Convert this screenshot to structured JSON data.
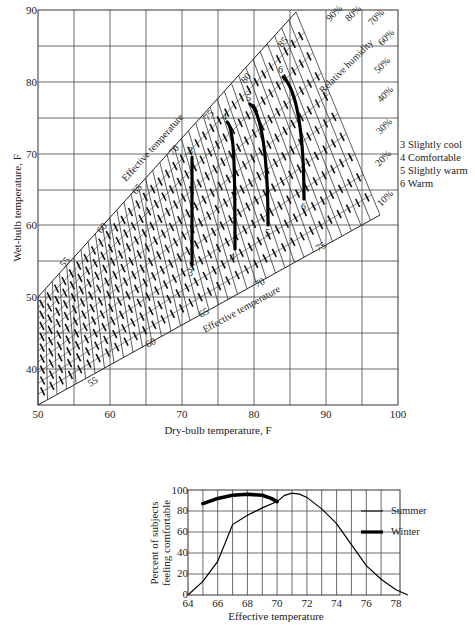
{
  "chart_data": [
    {
      "type": "line",
      "title": "",
      "xlabel": "Dry-bulb temperature, F",
      "ylabel": "Wet-bulb temperature, F",
      "xlim": [
        50,
        100
      ],
      "ylim": [
        35,
        90
      ],
      "x_ticks": [
        50,
        60,
        70,
        80,
        90,
        100
      ],
      "y_ticks": [
        40,
        50,
        60,
        70,
        80,
        90
      ],
      "grid": true,
      "band_labels": {
        "upper_boundary": "Effective temperature",
        "lower_boundary": "Effective temperature",
        "humidity_axis": "Relative humidity"
      },
      "effective_temperature_ticks_upper": [
        55,
        60,
        65,
        70,
        75,
        80,
        85
      ],
      "effective_temperature_ticks_lower": [
        55,
        60,
        65,
        70,
        75
      ],
      "relative_humidity_labels": [
        "90%",
        "80%",
        "70%",
        "60%",
        "50%",
        "40%",
        "30%",
        "20%",
        "10%"
      ],
      "series": [
        {
          "name": "3 Slightly cool",
          "id": "3",
          "points": [
            [
              71.5,
              68.6
            ],
            [
              71.5,
              64
            ],
            [
              71.5,
              59
            ],
            [
              71.6,
              53.6
            ]
          ]
        },
        {
          "name": "4 Comfortable",
          "id": "4",
          "points": [
            [
              76.2,
              73.6
            ],
            [
              77.0,
              71.5
            ],
            [
              77.3,
              66
            ],
            [
              77.3,
              61
            ],
            [
              77.4,
              56.8
            ]
          ]
        },
        {
          "name": "5 Slightly warm",
          "id": "5",
          "points": [
            [
              79.4,
              76.6
            ],
            [
              80.6,
              74.8
            ],
            [
              81.6,
              70
            ],
            [
              82.0,
              65
            ],
            [
              82.3,
              60.3
            ]
          ]
        },
        {
          "name": "6 Warm",
          "id": "6",
          "points": [
            [
              83.8,
              80.6
            ],
            [
              85.0,
              78.5
            ],
            [
              86.2,
              73
            ],
            [
              86.6,
              68
            ],
            [
              86.8,
              63.4
            ]
          ]
        }
      ],
      "legend": [
        "3 Slightly cool",
        "4 Comfortable",
        "5 Slightly warm",
        "6 Warm"
      ]
    },
    {
      "type": "line",
      "title": "",
      "xlabel": "Effective temperature",
      "ylabel": "Percent of subjects feeling comfortable",
      "xlim": [
        64,
        79
      ],
      "ylim": [
        0,
        100
      ],
      "x_ticks": [
        64,
        66,
        68,
        70,
        72,
        74,
        76,
        78
      ],
      "y_ticks": [
        0,
        20,
        40,
        60,
        80,
        100
      ],
      "grid": true,
      "legend_position": "right",
      "series": [
        {
          "name": "Summer",
          "x": [
            64,
            65,
            66,
            67,
            68,
            69,
            70,
            70.5,
            71,
            71.5,
            72,
            73,
            74,
            75,
            76,
            77,
            78,
            78.8
          ],
          "y": [
            0,
            13,
            32,
            67,
            76,
            83,
            89,
            95,
            97,
            96,
            93,
            82,
            68,
            48,
            28,
            15,
            5,
            0
          ]
        },
        {
          "name": "Winter",
          "x": [
            65,
            66,
            67,
            68,
            69,
            69.6,
            70
          ],
          "y": [
            87,
            92,
            95,
            96,
            95,
            92,
            89
          ]
        }
      ]
    }
  ],
  "upper": {
    "xlabel": "Dry-bulb temperature, F",
    "ylabel": "Wet-bulb temperature, F",
    "x_ticks": [
      "50",
      "60",
      "70",
      "80",
      "90",
      "100"
    ],
    "y_ticks": [
      "90",
      "80",
      "70",
      "60",
      "50",
      "40"
    ],
    "et_label_upper": "Effective temperature",
    "et_label_lower": "Effective temperature",
    "rh_label": "Relative humidity",
    "et_upper": [
      "55",
      "60",
      "65",
      "70",
      "75",
      "80",
      "85"
    ],
    "et_lower": [
      "55",
      "60",
      "65",
      "70",
      "75"
    ],
    "rh": [
      "90%",
      "80%",
      "70%",
      "60%",
      "50%",
      "40%",
      "30%",
      "20%",
      "10%"
    ],
    "curve_ids": [
      "3",
      "4",
      "5",
      "6"
    ],
    "legend": [
      "3 Slightly cool",
      "4 Comfortable",
      "5 Slightly warm",
      "6 Warm"
    ]
  },
  "lower": {
    "xlabel": "Effective temperature",
    "ylabel_line1": "Percent of subjects",
    "ylabel_line2": "feeling comfortable",
    "x_ticks": [
      "64",
      "66",
      "68",
      "70",
      "72",
      "74",
      "76",
      "78"
    ],
    "y_ticks": [
      "0",
      "20",
      "40",
      "60",
      "80",
      "100"
    ],
    "legend_summer": "Summer",
    "legend_winter": "Winter"
  }
}
